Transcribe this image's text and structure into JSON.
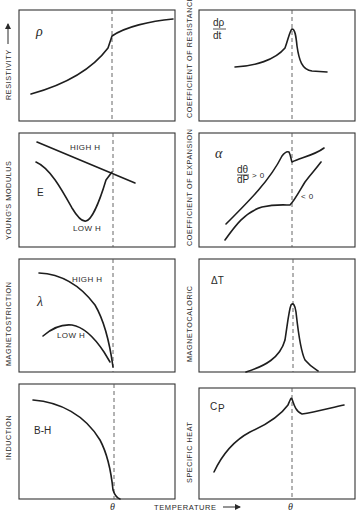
{
  "figure": {
    "x_axis_label": "TEMPERATURE",
    "curie_symbol": "θ",
    "panels": [
      {
        "id": "resistivity",
        "ylabel": "RESISTIVITY",
        "symbol": "ρ",
        "curves": [
          "rising curve with kink at θ"
        ]
      },
      {
        "id": "coefficient-of-resistance",
        "ylabel": "COEFFICIENT OF RESISTANCE",
        "symbol_num": "dρ",
        "symbol_den": "dt",
        "curves": [
          "peak at θ"
        ]
      },
      {
        "id": "youngs-modulus",
        "ylabel": "YOUNG'S MODULUS",
        "symbol": "E",
        "notes": [
          "HIGH H",
          "LOW H"
        ]
      },
      {
        "id": "coefficient-of-expansion",
        "ylabel": "COEFFICIENT OF EXPANSION",
        "symbol": "α",
        "frac_num": "dθ",
        "frac_den": "dP",
        "notes": [
          "> 0",
          "< 0"
        ]
      },
      {
        "id": "magnetostriction",
        "ylabel": "MAGNETOSTRICTION",
        "symbol": "λ",
        "notes": [
          "HIGH H",
          "LOW H"
        ]
      },
      {
        "id": "magnetocaloric",
        "ylabel": "MAGNETOCALORIC",
        "symbol": "ΔT",
        "curves": [
          "sharp peak at θ"
        ]
      },
      {
        "id": "induction",
        "ylabel": "INDUCTION",
        "symbol": "B-H",
        "curves": [
          "falls to zero at θ"
        ]
      },
      {
        "id": "specific-heat",
        "ylabel": "SPECIFIC HEAT",
        "symbol": "C",
        "symbol_sub": "P",
        "curves": [
          "lambda peak at θ"
        ]
      }
    ]
  },
  "labels": {
    "resistivity": "RESISTIVITY",
    "coef_res": "COEFFICIENT OF RESISTANCE",
    "youngs": "YOUNG'S MODULUS",
    "coef_exp": "COEFFICIENT OF EXPANSION",
    "magnetostriction": "MAGNETOSTRICTION",
    "magnetocaloric": "MAGNETOCALORIC",
    "induction": "INDUCTION",
    "specific_heat": "SPECIFIC HEAT",
    "rho": "ρ",
    "drho": "dρ",
    "dt": "dt",
    "E": "E",
    "high_h": "HIGH H",
    "low_h": "LOW H",
    "alpha": "α",
    "dtheta": "dθ",
    "dP": "dP",
    "gt0": "> 0",
    "lt0": "< 0",
    "lambda": "λ",
    "deltaT": "ΔT",
    "BH": "B-H",
    "C": "C",
    "P": "P",
    "temperature": "TEMPERATURE",
    "theta": "θ"
  }
}
